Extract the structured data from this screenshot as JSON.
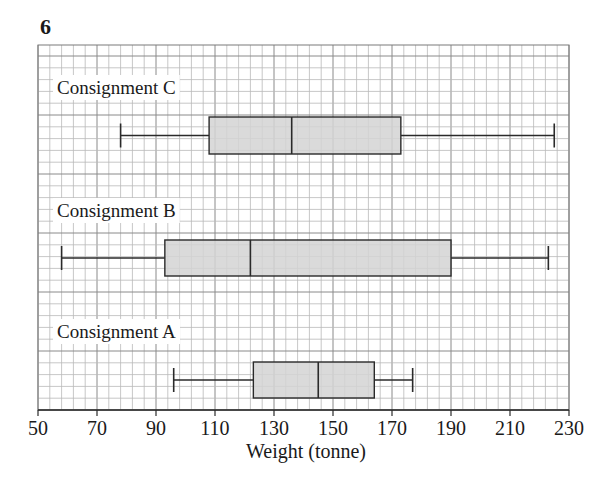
{
  "question_number": "6",
  "chart_data": {
    "type": "boxplot",
    "title": "",
    "xlabel": "Weight (tonne)",
    "ylabel": "",
    "xlim": [
      50,
      230
    ],
    "xticks": [
      50,
      70,
      90,
      110,
      130,
      150,
      170,
      190,
      210,
      230
    ],
    "grid": {
      "on": true,
      "minor_step": 4,
      "major_step": 20
    },
    "series": [
      {
        "name": "Consignment C",
        "min": 78,
        "q1": 108,
        "median": 136,
        "q3": 173,
        "max": 225
      },
      {
        "name": "Consignment B",
        "min": 58,
        "q1": 93,
        "median": 122,
        "q3": 190,
        "max": 223
      },
      {
        "name": "Consignment A",
        "min": 96,
        "q1": 123,
        "median": 145,
        "q3": 164,
        "max": 177
      }
    ],
    "box_fill": "#d3d3d3",
    "line_color": "#2a2a2a"
  }
}
